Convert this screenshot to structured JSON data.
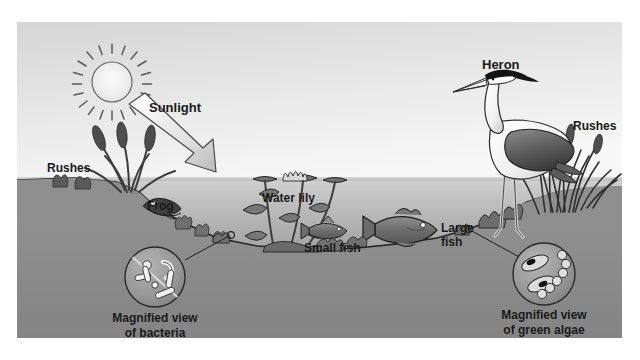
{
  "figure": {
    "frame": {
      "x": 17,
      "y": 22,
      "width": 605,
      "height": 316
    }
  },
  "palette": {
    "page_background": "#ffffff",
    "sky_top": "#d8d8d8",
    "sky_bottom": "#f2f2f2",
    "water_top": "#cfcfcf",
    "water_bottom": "#8a8a8a",
    "ground": "#8d8d8d",
    "ground_dark": "#7e7e7e",
    "outline": "#1f1f1f",
    "label_text": "#1a1a1a",
    "plant_dark": "#4a4a4a",
    "plant_mid": "#6e6e6e",
    "heron_white": "#fbfbfb",
    "heron_wing": "#6a6a6a",
    "heron_crest": "#141414",
    "arrow_light": "#ffffff",
    "arrow_shade": "#bcbcbc",
    "sun_fill": "#ededed"
  },
  "labels": [
    {
      "id": "sunlight",
      "text": "Sunlight",
      "x": 132,
      "y": 90,
      "anchor": "start",
      "size": 13
    },
    {
      "id": "rushes_left",
      "text": "Rushes",
      "x": 30,
      "y": 150,
      "anchor": "start",
      "size": 12
    },
    {
      "id": "frog",
      "text": "Frog",
      "x": 130,
      "y": 188,
      "anchor": "start",
      "size": 12
    },
    {
      "id": "water_lily",
      "text": "Water lily",
      "x": 245,
      "y": 180,
      "anchor": "start",
      "size": 12
    },
    {
      "id": "small_fish",
      "text": "Small fish",
      "x": 287,
      "y": 230,
      "anchor": "start",
      "size": 12
    },
    {
      "id": "heron",
      "text": "Heron",
      "x": 465,
      "y": 47,
      "anchor": "start",
      "size": 13
    },
    {
      "id": "rushes_right",
      "text": "Rushes",
      "x": 556,
      "y": 108,
      "anchor": "start",
      "size": 12
    }
  ],
  "multiline_labels": [
    {
      "id": "large_fish",
      "lines": [
        "Large",
        "fish"
      ],
      "x": 424,
      "y": 210,
      "line_height": 14,
      "anchor": "start",
      "size": 12
    },
    {
      "id": "magnified_bacteria",
      "lines": [
        "Magnified view",
        "of bacteria"
      ],
      "x": 138,
      "y": 300,
      "line_height": 15,
      "anchor": "middle",
      "size": 12
    },
    {
      "id": "magnified_green_algae",
      "lines": [
        "Magnified view",
        "of green algae"
      ],
      "x": 527,
      "y": 297,
      "line_height": 15,
      "anchor": "middle",
      "size": 12
    }
  ],
  "organisms": [
    {
      "id": "sun",
      "name": "Sun",
      "role": "energy source"
    },
    {
      "id": "sunlight-arrow",
      "name": "Sunlight",
      "role": "energy input"
    },
    {
      "id": "rushes-left",
      "name": "Rushes",
      "role": "producer"
    },
    {
      "id": "rushes-right",
      "name": "Rushes",
      "role": "producer"
    },
    {
      "id": "frog",
      "name": "Frog",
      "role": "consumer"
    },
    {
      "id": "water-lily",
      "name": "Water lily",
      "role": "producer"
    },
    {
      "id": "small-fish",
      "name": "Small fish",
      "role": "consumer"
    },
    {
      "id": "large-fish",
      "name": "Large fish",
      "role": "consumer"
    },
    {
      "id": "heron",
      "name": "Heron",
      "role": "top consumer"
    },
    {
      "id": "bacteria",
      "name": "Bacteria",
      "role": "decomposer"
    },
    {
      "id": "green-algae",
      "name": "Green algae",
      "role": "producer"
    }
  ],
  "callouts": [
    {
      "id": "bacteria-callout",
      "circle": {
        "cx": 138,
        "cy": 255,
        "r": 30
      },
      "leader_to": {
        "x": 214,
        "y": 215
      }
    },
    {
      "id": "algae-callout",
      "circle": {
        "cx": 527,
        "cy": 252,
        "r": 31
      },
      "leader_to": {
        "x": 452,
        "y": 207
      }
    }
  ]
}
